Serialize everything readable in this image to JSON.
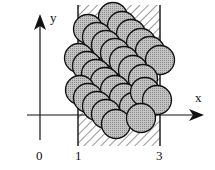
{
  "diagram": {
    "axes": {
      "x_label": "x",
      "y_label": "y",
      "ticks": [
        {
          "label": "0",
          "x": 40
        },
        {
          "label": "1",
          "x": 78
        },
        {
          "label": "3",
          "x": 160
        }
      ]
    },
    "walls": {
      "left_x": 78,
      "right_x": 160,
      "top_y": 5,
      "bottom_y": 146,
      "hatch": "diagonal"
    },
    "colors": {
      "disc_fill": "#b8b8b8",
      "disc_stroke": "#111111",
      "axis": "#111111",
      "hatch": "#333333",
      "background": "#ffffff"
    },
    "disc_radius": 14.5,
    "discs": [
      {
        "cx": 113,
        "cy": 17
      },
      {
        "cx": 122,
        "cy": 26
      },
      {
        "cx": 131,
        "cy": 34
      },
      {
        "cx": 141,
        "cy": 43
      },
      {
        "cx": 150,
        "cy": 51
      },
      {
        "cx": 160,
        "cy": 60
      },
      {
        "cx": 88,
        "cy": 29
      },
      {
        "cx": 97,
        "cy": 37
      },
      {
        "cx": 106,
        "cy": 45
      },
      {
        "cx": 115,
        "cy": 53
      },
      {
        "cx": 124,
        "cy": 61
      },
      {
        "cx": 133,
        "cy": 70
      },
      {
        "cx": 143,
        "cy": 79
      },
      {
        "cx": 79,
        "cy": 58
      },
      {
        "cx": 87,
        "cy": 66
      },
      {
        "cx": 96,
        "cy": 74
      },
      {
        "cx": 105,
        "cy": 82
      },
      {
        "cx": 115,
        "cy": 90
      },
      {
        "cx": 124,
        "cy": 98
      },
      {
        "cx": 134,
        "cy": 107
      },
      {
        "cx": 145,
        "cy": 92
      },
      {
        "cx": 157,
        "cy": 100
      },
      {
        "cx": 80,
        "cy": 90
      },
      {
        "cx": 88,
        "cy": 98
      },
      {
        "cx": 97,
        "cy": 106
      },
      {
        "cx": 106,
        "cy": 114
      },
      {
        "cx": 116,
        "cy": 124
      },
      {
        "cx": 141,
        "cy": 118
      }
    ]
  }
}
